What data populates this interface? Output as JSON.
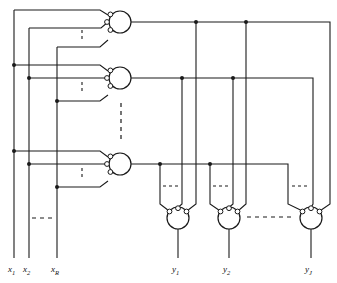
{
  "figure": {
    "type": "logic-array-diagram",
    "stroke_color": "#1a1a1a",
    "background_color": "#ffffff"
  },
  "inputs": {
    "count_shown": 3,
    "labels": [
      {
        "base": "x",
        "sub": "1",
        "x": 12,
        "y": 271
      },
      {
        "base": "x",
        "sub": "2",
        "x": 28,
        "y": 271
      },
      {
        "base": "x",
        "sub": "R",
        "x": 56,
        "y": 271
      }
    ],
    "rails_x": [
      14,
      29,
      57
    ],
    "ellipsis_label": "horizontal-dashed-ellipsis"
  },
  "outputs": {
    "count_shown": 3,
    "labels": [
      {
        "base": "y",
        "sub": "1",
        "x": 172,
        "y": 271
      },
      {
        "base": "y",
        "sub": "2",
        "x": 223,
        "y": 271
      },
      {
        "base": "y",
        "sub": "J",
        "x": 305,
        "y": 271
      }
    ],
    "rails_x": [
      178,
      229,
      311
    ]
  },
  "and_plane": {
    "gate_count_shown": 3,
    "gate_radius": 11,
    "bubble_radius": 2.4,
    "gates": [
      {
        "name": "and-gate-1",
        "cx": 120,
        "cy": 22,
        "inputs": 3
      },
      {
        "name": "and-gate-2",
        "cx": 120,
        "cy": 78,
        "inputs": 3
      },
      {
        "name": "and-gate-3",
        "cx": 120,
        "cy": 164,
        "inputs": 3
      }
    ]
  },
  "or_plane": {
    "gate_count_shown": 3,
    "gate_radius": 11,
    "bubble_radius": 2.4,
    "gates": [
      {
        "name": "or-gate-y1",
        "cx": 178,
        "cy": 218,
        "inputs": 3
      },
      {
        "name": "or-gate-y2",
        "cx": 229,
        "cy": 218,
        "inputs": 3
      },
      {
        "name": "or-gate-yj",
        "cx": 311,
        "cy": 218,
        "inputs": 3
      }
    ]
  },
  "ellipses": {
    "and_gate_input_vertical_dashes": "vertical-dashed-ellipsis",
    "and_gate_column_dashes": "vertical-dashed-ellipsis",
    "input_rail_dashes": "horizontal-dashed-ellipsis",
    "or_gate_input_dashes": "horizontal-dashed-ellipsis",
    "or_gate_row_dashes": "horizontal-dashed-ellipsis"
  },
  "junction_dots": {
    "radius": 2.0,
    "description": "filled connection dots at wire crossings"
  }
}
